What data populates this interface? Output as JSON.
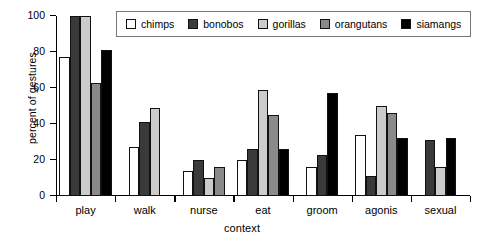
{
  "chart_data": {
    "type": "bar",
    "title": "",
    "xlabel": "context",
    "ylabel": "percent of gestures",
    "ylim": [
      0,
      100
    ],
    "yticks": [
      0,
      20,
      40,
      60,
      80,
      100
    ],
    "grid": false,
    "legend_position": "top-right",
    "categories": [
      "play",
      "walk",
      "nurse",
      "eat",
      "groom",
      "agonis",
      "sexual"
    ],
    "series": [
      {
        "name": "chimps",
        "color": "#ffffff",
        "values": [
          77,
          27,
          14,
          20,
          16,
          34,
          null
        ]
      },
      {
        "name": "bonobos",
        "color": "#3a3a3a",
        "values": [
          100,
          41,
          20,
          26,
          23,
          11,
          31
        ]
      },
      {
        "name": "gorillas",
        "color": "#cccccc",
        "values": [
          100,
          49,
          10,
          59,
          null,
          50,
          16
        ]
      },
      {
        "name": "orangutans",
        "color": "#8a8a8a",
        "values": [
          63,
          null,
          16,
          45,
          null,
          46,
          null
        ]
      },
      {
        "name": "siamangs",
        "color": "#000000",
        "values": [
          81,
          null,
          null,
          26,
          57,
          32,
          32
        ]
      }
    ]
  },
  "axis": {
    "ytick_labels": [
      "0",
      "20",
      "40",
      "60",
      "80",
      "100"
    ]
  }
}
